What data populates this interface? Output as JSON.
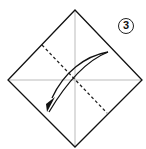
{
  "diagram": {
    "step_number": "3",
    "colors": {
      "outline": "#111111",
      "crease": "#bbbbbb",
      "fold_line": "#222222",
      "arrow": "#111111",
      "background": "#ffffff"
    }
  }
}
